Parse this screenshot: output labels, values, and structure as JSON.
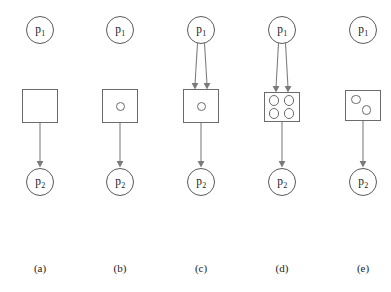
{
  "figure": {
    "type": "petri-net-sequence",
    "background_color": "#ffffff",
    "stroke_color": "#6b6b6b",
    "arrow_color": "#7a7a7a",
    "text_color": "#1a1a1a",
    "place_label_top": "p",
    "place_label_top_sub": "1",
    "place_label_bottom": "p",
    "place_label_bottom_sub": "2"
  },
  "panels": [
    {
      "id": "a",
      "caption": "(a)",
      "top_place": {
        "name": "p",
        "sub": "1"
      },
      "bottom_place": {
        "name": "p",
        "sub": "2"
      },
      "transition": {
        "tokens": 0,
        "token_layout": "none",
        "width": 36,
        "height": 34
      },
      "input_arcs": 0,
      "output_arcs": 1
    },
    {
      "id": "b",
      "caption": "(b)",
      "top_place": {
        "name": "p",
        "sub": "1"
      },
      "bottom_place": {
        "name": "p",
        "sub": "2"
      },
      "transition": {
        "tokens": 1,
        "token_layout": "center",
        "width": 36,
        "height": 34
      },
      "input_arcs": 0,
      "output_arcs": 1
    },
    {
      "id": "c",
      "caption": "(c)",
      "top_place": {
        "name": "p",
        "sub": "1"
      },
      "bottom_place": {
        "name": "p",
        "sub": "2"
      },
      "transition": {
        "tokens": 1,
        "token_layout": "center",
        "width": 36,
        "height": 34
      },
      "input_arcs": 2,
      "output_arcs": 1
    },
    {
      "id": "d",
      "caption": "(d)",
      "top_place": {
        "name": "p",
        "sub": "1"
      },
      "bottom_place": {
        "name": "p",
        "sub": "2"
      },
      "transition": {
        "tokens": 4,
        "token_layout": "grid-2x2",
        "width": 36,
        "height": 30
      },
      "input_arcs": 2,
      "output_arcs": 1
    },
    {
      "id": "e",
      "caption": "(e)",
      "top_place": {
        "name": "p",
        "sub": "1"
      },
      "bottom_place": {
        "name": "p",
        "sub": "2"
      },
      "transition": {
        "tokens": 2,
        "token_layout": "diagonal",
        "width": 36,
        "height": 31
      },
      "input_arcs": 0,
      "output_arcs": 1
    }
  ]
}
